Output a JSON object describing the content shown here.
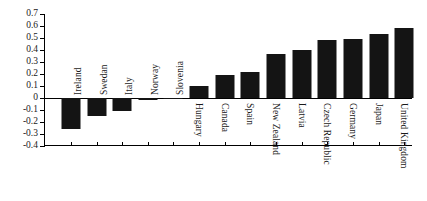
{
  "chart_data": {
    "type": "bar",
    "title": "",
    "subtitle": "",
    "xlabel": "",
    "ylabel": "",
    "ylim": [
      -0.4,
      0.7
    ],
    "ytick_step": 0.1,
    "grid": false,
    "legend": null,
    "orientation": "vertical",
    "bar_color": "#141414",
    "categories": [
      "Ireland",
      "Swedan",
      "Italy",
      "Norway",
      "Slovenia",
      "Hungary",
      "Canada",
      "Spain",
      "New Zealand",
      "Latvia",
      "Czech Republic",
      "Germany",
      "Japan",
      "United Kingdom"
    ],
    "values": [
      -0.26,
      -0.15,
      -0.105,
      -0.015,
      -0.005,
      0.1,
      0.19,
      0.22,
      0.37,
      0.4,
      0.48,
      0.49,
      0.53,
      0.58
    ],
    "ytick_labels": [
      "0.7",
      "0.6",
      "0.5",
      "0.4",
      "0.3",
      "0.2",
      "0.1",
      "0",
      "-0.1",
      "-0.2",
      "-0.3",
      "-0.4"
    ],
    "ytick_values": [
      0.7,
      0.6,
      0.5,
      0.4,
      0.3,
      0.2,
      0.1,
      0,
      -0.1,
      -0.2,
      -0.3,
      -0.4
    ]
  }
}
